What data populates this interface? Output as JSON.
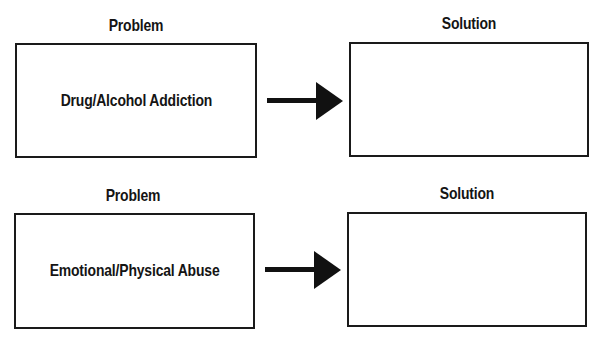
{
  "rows": [
    {
      "problem_heading": "Problem",
      "problem_text": "Drug/Alcohol Addiction",
      "solution_heading": "Solution",
      "solution_text": ""
    },
    {
      "problem_heading": "Problem",
      "problem_text": "Emotional/Physical Abuse",
      "solution_heading": "Solution",
      "solution_text": ""
    }
  ],
  "arrow_icon": "right-arrow-icon",
  "colors": {
    "stroke": "#1a1a1a",
    "background": "#ffffff"
  }
}
